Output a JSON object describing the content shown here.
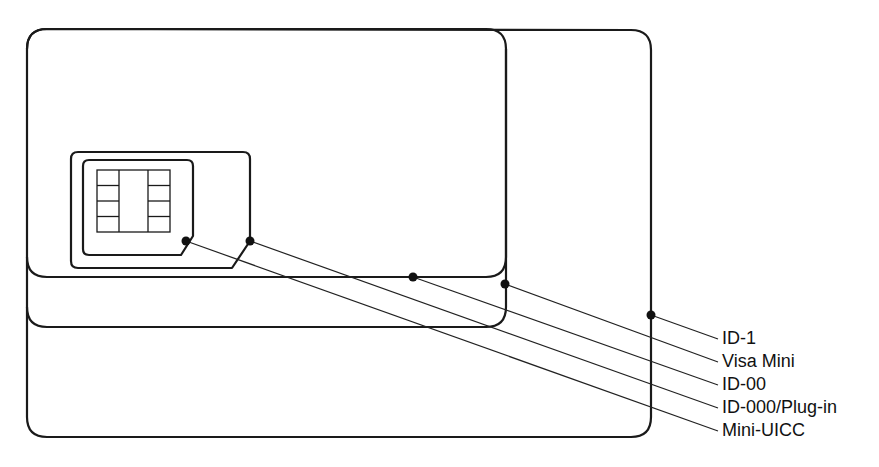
{
  "diagram": {
    "stroke_color": "#1a1a1a",
    "background": "#ffffff",
    "labels": [
      {
        "id": "id-1",
        "text": "ID-1"
      },
      {
        "id": "visa-mini",
        "text": "Visa Mini"
      },
      {
        "id": "id-00",
        "text": "ID-00"
      },
      {
        "id": "id-000",
        "text": "ID-000/Plug-in"
      },
      {
        "id": "mini-uicc",
        "text": "Mini-UICC"
      }
    ],
    "chip": {
      "contacts_per_side": 4,
      "columns": 2
    }
  }
}
